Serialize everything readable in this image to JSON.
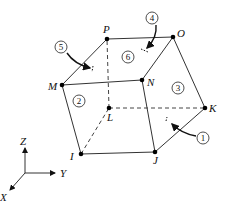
{
  "diagram": {
    "type": "hexahedral-element",
    "nodes": [
      {
        "id": "I",
        "x": 81,
        "y": 154,
        "label": "I"
      },
      {
        "id": "J",
        "x": 155,
        "y": 152,
        "label": "J"
      },
      {
        "id": "K",
        "x": 205,
        "y": 108,
        "label": "K"
      },
      {
        "id": "L",
        "x": 109,
        "y": 108,
        "label": "L"
      },
      {
        "id": "M",
        "x": 62,
        "y": 85,
        "label": "M"
      },
      {
        "id": "N",
        "x": 142,
        "y": 80,
        "label": "N"
      },
      {
        "id": "O",
        "x": 173,
        "y": 37,
        "label": "O"
      },
      {
        "id": "P",
        "x": 107,
        "y": 39,
        "label": "P"
      }
    ],
    "edges_visible": [
      [
        "I",
        "J"
      ],
      [
        "J",
        "K"
      ],
      [
        "K",
        "O"
      ],
      [
        "O",
        "P"
      ],
      [
        "P",
        "M"
      ],
      [
        "M",
        "N"
      ],
      [
        "N",
        "O"
      ],
      [
        "M",
        "I"
      ],
      [
        "N",
        "J"
      ]
    ],
    "edges_hidden": [
      [
        "I",
        "L"
      ],
      [
        "L",
        "K"
      ],
      [
        "L",
        "P"
      ]
    ],
    "faces": [
      {
        "number": "1",
        "label_x": 209,
        "label_y": 141
      },
      {
        "number": "2",
        "label_x": 80,
        "label_y": 103
      },
      {
        "number": "3",
        "label_x": 178,
        "label_y": 87
      },
      {
        "number": "4",
        "label_x": 152,
        "label_y": 17
      },
      {
        "number": "5",
        "label_x": 61,
        "label_y": 47
      },
      {
        "number": "6",
        "label_x": 128,
        "label_y": 57
      }
    ],
    "axes": {
      "origin": {
        "x": 25,
        "y": 173
      },
      "labels": {
        "z": "Z",
        "y": "Y",
        "x": "X"
      }
    }
  }
}
